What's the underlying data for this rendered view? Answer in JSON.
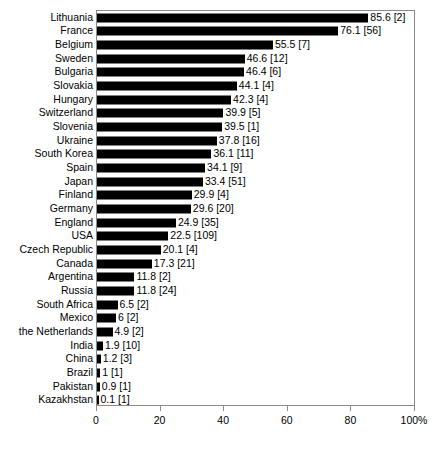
{
  "chart_data": {
    "type": "bar",
    "orientation": "horizontal",
    "title": "",
    "xlabel": "",
    "ylabel": "",
    "xlim": [
      0,
      100
    ],
    "grid": false,
    "legend": false,
    "axis_suffix": "%",
    "x_ticks": [
      {
        "value": 0,
        "label": "0"
      },
      {
        "value": 20,
        "label": "20"
      },
      {
        "value": 40,
        "label": "40"
      },
      {
        "value": 60,
        "label": "60"
      },
      {
        "value": 80,
        "label": "80"
      },
      {
        "value": 100,
        "label": "100%"
      }
    ],
    "categories": [
      "Lithuania",
      "France",
      "Belgium",
      "Sweden",
      "Bulgaria",
      "Slovakia",
      "Hungary",
      "Switzerland",
      "Slovenia",
      "Ukraine",
      "South Korea",
      "Spain",
      "Japan",
      "Finland",
      "Germany",
      "England",
      "USA",
      "Czech Republic",
      "Canada",
      "Argentina",
      "Russia",
      "South Africa",
      "Mexico",
      "the Netherlands",
      "India",
      "China",
      "Brazil",
      "Pakistan",
      "Kazakhstan"
    ],
    "values": [
      85.6,
      76.1,
      55.5,
      46.6,
      46.4,
      44.1,
      42.3,
      39.9,
      39.5,
      37.8,
      36.1,
      34.1,
      33.4,
      29.9,
      29.6,
      24.9,
      22.5,
      20.1,
      17.3,
      11.8,
      11.8,
      6.5,
      6,
      4.9,
      1.9,
      1.2,
      1,
      0.9,
      0.1
    ],
    "counts": [
      2,
      56,
      7,
      12,
      6,
      4,
      4,
      5,
      1,
      16,
      11,
      9,
      51,
      4,
      20,
      35,
      109,
      4,
      21,
      2,
      24,
      2,
      2,
      2,
      10,
      3,
      1,
      1,
      1
    ],
    "point_labels": [
      "85.6 [2]",
      "76.1 [56]",
      "55.5 [7]",
      "46.6 [12]",
      "46.4 [6]",
      "44.1 [4]",
      "42.3 [4]",
      "39.9 [5]",
      "39.5 [1]",
      "37.8 [16]",
      "36.1 [11]",
      "34.1 [9]",
      "33.4 [51]",
      "29.9 [4]",
      "29.6 [20]",
      "24.9 [35]",
      "22.5 [109]",
      "20.1 [4]",
      "17.3 [21]",
      "11.8 [2]",
      "11.8 [24]",
      "6.5 [2]",
      "6 [2]",
      "4.9 [2]",
      "1.9 [10]",
      "1.2 [3]",
      "1 [1]",
      "0.9 [1]",
      "0.1 [1]"
    ],
    "bar_color": "#000000",
    "axis_color": "#8a8a8a",
    "background": "#ffffff"
  }
}
